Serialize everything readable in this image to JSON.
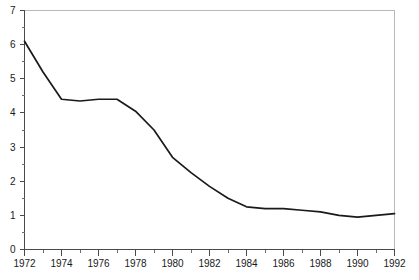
{
  "chart_data": {
    "type": "line",
    "title": "",
    "subtitle": "",
    "xlabel": "",
    "ylabel": "",
    "xlim": [
      1972,
      1992
    ],
    "ylim": [
      0,
      7
    ],
    "grid": false,
    "legend": false,
    "legend_position": "none",
    "x_ticks_major": [
      1972,
      1974,
      1976,
      1978,
      1980,
      1982,
      1984,
      1986,
      1988,
      1990,
      1992
    ],
    "x_tick_labels": [
      "1972",
      "1974",
      "1976",
      "1978",
      "1980",
      "1982",
      "1984",
      "1986",
      "1988",
      "1990",
      "1992"
    ],
    "x_ticks_minor": [
      1973,
      1975,
      1977,
      1979,
      1981,
      1983,
      1985,
      1987,
      1989,
      1991
    ],
    "y_ticks_major": [
      0,
      1,
      2,
      3,
      4,
      5,
      6,
      7
    ],
    "y_tick_labels": [
      "0",
      "1",
      "2",
      "3",
      "4",
      "5",
      "6",
      "7"
    ],
    "y_ticks_minor": [
      0.5,
      1.5,
      2.5,
      3.5,
      4.5,
      5.5,
      6.5
    ],
    "x": [
      1972,
      1973,
      1974,
      1975,
      1976,
      1977,
      1978,
      1979,
      1980,
      1981,
      1982,
      1983,
      1984,
      1985,
      1986,
      1987,
      1988,
      1989,
      1990,
      1991,
      1992
    ],
    "values": [
      6.1,
      5.2,
      4.4,
      4.35,
      4.4,
      4.4,
      4.05,
      3.5,
      2.7,
      2.25,
      1.85,
      1.5,
      1.25,
      1.2,
      1.2,
      1.15,
      1.1,
      1.0,
      0.95,
      1.0,
      1.05
    ],
    "series": [
      {
        "name": "series-1",
        "color": "#1a1a1a",
        "values": [
          6.1,
          5.2,
          4.4,
          4.35,
          4.4,
          4.4,
          4.05,
          3.5,
          2.7,
          2.25,
          1.85,
          1.5,
          1.25,
          1.2,
          1.2,
          1.15,
          1.1,
          1.0,
          0.95,
          1.0,
          1.05
        ]
      }
    ]
  },
  "colors": {
    "line": "#1a1a1a",
    "axis": "#4a4a4a",
    "frame": "#b9b9b9",
    "background": "#ffffff",
    "text": "#1a1a1a"
  }
}
